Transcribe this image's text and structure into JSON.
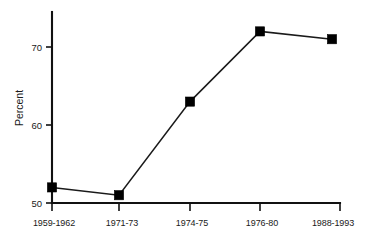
{
  "chart_data": {
    "type": "line",
    "title": "",
    "subtitle": "",
    "xlabel": "",
    "ylabel": "Percent",
    "categories": [
      "1959-1962",
      "1971-73",
      "1974-75",
      "1976-80",
      "1988-1993"
    ],
    "values": [
      52,
      51,
      63,
      72,
      71
    ],
    "series": [
      {
        "name": "Percent",
        "values": [
          52,
          51,
          63,
          72,
          71
        ]
      }
    ],
    "ylim": [
      50,
      73
    ],
    "yticks": [
      50,
      60,
      70
    ],
    "ytick_labels": [
      "50",
      "60",
      "70"
    ],
    "grid": false,
    "legend": false,
    "legend_position": "none",
    "marker": "square",
    "line_color": "#1a1a1a",
    "marker_color": "#000000",
    "background_color": "#ffffff"
  },
  "axes": {
    "y_axis_title": "Percent",
    "y_tick_labels": [
      "70",
      "60",
      "50"
    ],
    "x_tick_labels": [
      "1959-1962",
      "1971-73",
      "1974-75",
      "1976-80",
      "1988-1993"
    ]
  }
}
